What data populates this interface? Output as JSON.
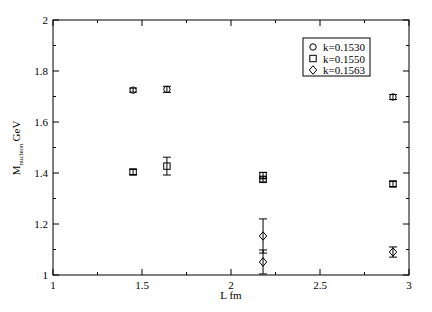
{
  "chart_data": {
    "type": "scatter",
    "title": "",
    "xlabel": "L fm",
    "ylabel_main": "M",
    "ylabel_sub": "nucleon",
    "ylabel_unit": "GeV",
    "xlim": [
      1,
      3
    ],
    "ylim": [
      1,
      2
    ],
    "x_ticks": [
      1,
      1.5,
      2,
      2.5,
      3
    ],
    "x_tick_labels": [
      "1",
      "1.5",
      "2",
      "2.5",
      "3"
    ],
    "x_minor_ticks": [
      1.25,
      1.75,
      2.25,
      2.75
    ],
    "y_ticks": [
      1,
      1.2,
      1.4,
      1.6,
      1.8,
      2
    ],
    "y_tick_labels": [
      "1",
      "1.2",
      "1.4",
      "1.6",
      "1.8",
      "2"
    ],
    "y_minor_ticks": [
      1.1,
      1.3,
      1.5,
      1.7,
      1.9
    ],
    "grid": false,
    "legend_position": "upper right",
    "series": [
      {
        "name": "k=0.1530",
        "marker": "circle",
        "points": [
          {
            "x": 1.45,
            "y": 1.725,
            "err": 0.008
          },
          {
            "x": 1.64,
            "y": 1.728,
            "err": 0.012
          },
          {
            "x": 2.91,
            "y": 1.698,
            "err": 0.01
          }
        ]
      },
      {
        "name": "k=0.1550",
        "marker": "square",
        "points": [
          {
            "x": 1.45,
            "y": 1.404,
            "err": 0.01
          },
          {
            "x": 1.64,
            "y": 1.427,
            "err": 0.035
          },
          {
            "x": 2.18,
            "y": 1.39,
            "err": 0.012
          },
          {
            "x": 2.18,
            "y": 1.375,
            "err": 0.01
          },
          {
            "x": 2.91,
            "y": 1.357,
            "err": 0.01
          }
        ]
      },
      {
        "name": "k=0.1563",
        "marker": "diamond",
        "points": [
          {
            "x": 2.18,
            "y": 1.153,
            "err": 0.067
          },
          {
            "x": 2.18,
            "y": 1.051,
            "err": 0.047
          },
          {
            "x": 2.91,
            "y": 1.09,
            "err": 0.02
          }
        ]
      }
    ]
  },
  "legend": {
    "items": [
      {
        "label": "k=0.1530",
        "marker": "circle"
      },
      {
        "label": "k=0.1550",
        "marker": "square"
      },
      {
        "label": "k=0.1563",
        "marker": "diamond"
      }
    ]
  }
}
